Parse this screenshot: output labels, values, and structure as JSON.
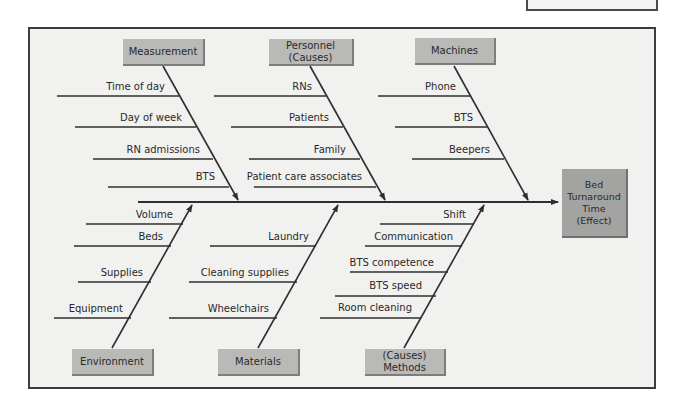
{
  "diagram": {
    "type": "fishbone",
    "effect": {
      "label": "Bed\nTurnaround\nTime\n(Effect)"
    },
    "categories": {
      "measurement": {
        "label": "Measurement",
        "causes": [
          "Time of day",
          "Day of week",
          "RN admissions",
          "BTS"
        ]
      },
      "personnel": {
        "label": "Personnel\n(Causes)",
        "causes": [
          "RNs",
          "Patients",
          "Family",
          "Patient care associates"
        ]
      },
      "machines": {
        "label": "Machines",
        "causes": [
          "Phone",
          "BTS",
          "Beepers"
        ]
      },
      "environment": {
        "label": "Environment",
        "causes": [
          "Volume",
          "Beds",
          "Supplies",
          "Equipment"
        ]
      },
      "materials": {
        "label": "Materials",
        "causes": [
          "Laundry",
          "Cleaning supplies",
          "Wheelchairs"
        ]
      },
      "methods": {
        "label": "(Causes)\nMethods",
        "causes": [
          "Shift",
          "Communication",
          "BTS competence",
          "BTS speed",
          "Room cleaning"
        ]
      }
    },
    "colors": {
      "frame_bg": "#f1f1ef",
      "box": "#b9b9b7",
      "effect_box": "#a3a3a1",
      "line": "#2e2e2e"
    }
  }
}
